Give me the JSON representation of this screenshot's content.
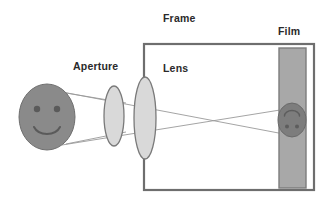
{
  "diagram": {
    "type": "optical-ray-diagram",
    "canvas": {
      "width": 334,
      "height": 205,
      "background": "#ffffff"
    },
    "labels": {
      "frame": "Frame",
      "aperture": "Aperture",
      "lens": "Lens",
      "film": "Film"
    },
    "colors": {
      "object_face_fill": "#8a8a8a",
      "object_face_stroke": "#6f6f6f",
      "face_feature": "#5a5a5a",
      "lens_fill": "#d6d6d6",
      "lens_stroke": "#7a7a7a",
      "aperture_fill": "#d6d6d6",
      "aperture_stroke": "#7a7a7a",
      "frame_stroke": "#6e6e6e",
      "film_fill": "#a8a8a8",
      "film_stroke": "#7d7d7d",
      "image_face_fill": "#7d7d7d",
      "image_face_stroke": "#6a6a6a",
      "ray_stroke": "#9a9a9a",
      "label_text": "#2a2a2a"
    },
    "elements": {
      "object_face": {
        "name": "smiley-face-object",
        "shape": "ellipse",
        "cx": 47,
        "cy": 117,
        "rx": 28,
        "ry": 33,
        "orientation": "upright",
        "eyes": [
          {
            "cx": 37,
            "cy": 109,
            "r": 3.2
          },
          {
            "cx": 57,
            "cy": 109,
            "r": 3.2
          }
        ],
        "mouth": {
          "type": "smile-arc",
          "cx": 47,
          "cy": 125,
          "rx": 14,
          "ry": 10
        }
      },
      "aperture": {
        "name": "aperture-ellipse",
        "shape": "ellipse",
        "cx": 114,
        "cy": 116,
        "rx": 10,
        "ry": 30
      },
      "lens": {
        "name": "lens-ellipse",
        "shape": "ellipse",
        "cx": 145,
        "cy": 118,
        "rx": 11,
        "ry": 41
      },
      "frame": {
        "name": "camera-frame",
        "shape": "rectangle",
        "x": 144,
        "y": 44,
        "width": 170,
        "height": 146,
        "stroke_width": 2.2
      },
      "film": {
        "name": "film-strip",
        "shape": "rectangle",
        "x": 279,
        "y": 48,
        "width": 27,
        "height": 140,
        "stroke_width": 1.4
      },
      "image_face": {
        "name": "inverted-smiley-image",
        "shape": "ellipse",
        "cx": 292,
        "cy": 120,
        "rx": 14,
        "ry": 17,
        "orientation": "inverted",
        "eyes": [
          {
            "cx": 287,
            "cy": 126,
            "r": 2.0
          },
          {
            "cx": 297,
            "cy": 126,
            "r": 2.0
          }
        ],
        "mouth": {
          "type": "inverted-smile-arc",
          "cx": 292,
          "cy": 114,
          "rx": 7.5,
          "ry": 5.5
        }
      },
      "rays": {
        "name": "light-ray-bundle",
        "crossing_point": {
          "x": 205,
          "y": 117
        },
        "lines": [
          {
            "id": "ray-top-to-bottom",
            "x1": 62,
            "y1": 92,
            "x2": 305,
            "y2": 138
          },
          {
            "id": "ray-bottom-to-top",
            "x1": 62,
            "y1": 145,
            "x2": 305,
            "y2": 106
          },
          {
            "id": "ray-top-edge-upper",
            "x1": 66,
            "y1": 93,
            "x2": 124,
            "y2": 103
          },
          {
            "id": "ray-bottom-edge-lower",
            "x1": 66,
            "y1": 144,
            "x2": 124,
            "y2": 132
          }
        ]
      }
    }
  }
}
